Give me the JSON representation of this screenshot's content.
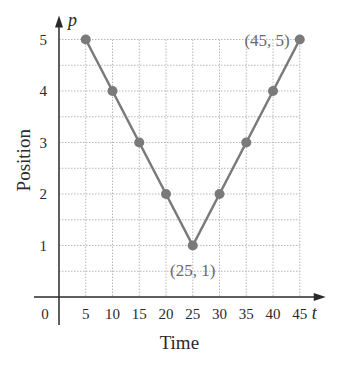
{
  "chart_data": {
    "type": "line",
    "title": "",
    "xlabel": "Time",
    "ylabel": "Position",
    "x_axis_var": "t",
    "y_axis_var": "p",
    "x": [
      5,
      10,
      15,
      20,
      25,
      30,
      35,
      40,
      45
    ],
    "series": [
      {
        "name": "position",
        "values": [
          5,
          4,
          3,
          2,
          1,
          2,
          3,
          4,
          5
        ]
      }
    ],
    "x_ticks": [
      "0",
      "5",
      "10",
      "15",
      "20",
      "25",
      "30",
      "35",
      "40",
      "45"
    ],
    "y_ticks": [
      "1",
      "2",
      "3",
      "4",
      "5"
    ],
    "xlim": [
      0,
      45
    ],
    "ylim": [
      0,
      5
    ],
    "grid": true,
    "annotations": [
      {
        "text": "(45, 5)",
        "x": 45,
        "y": 5
      },
      {
        "text": "(25, 1)",
        "x": 25,
        "y": 1
      }
    ],
    "legend": null
  },
  "colors": {
    "line": "#7a7a7a",
    "marker": "#7a7a7a",
    "axis": "#2a2a2a",
    "grid": "#b8b8b8",
    "text": "#2a2a2a",
    "annotation": "#6a6a6a"
  }
}
